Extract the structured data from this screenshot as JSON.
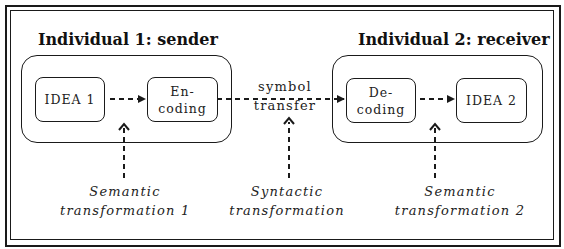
{
  "diagram": {
    "sender": {
      "title": "Individual 1: sender",
      "idea": "IDEA 1",
      "encoding": [
        "En-",
        "coding"
      ]
    },
    "receiver": {
      "title": "Individual 2: receiver",
      "decoding": [
        "De-",
        "coding"
      ],
      "idea": "IDEA 2"
    },
    "channel": {
      "line1": "symbol",
      "line2": "transfer"
    },
    "transformations": [
      {
        "line1": "Semantic",
        "line2": "transformation 1"
      },
      {
        "line1": "Syntactic",
        "line2": "transformation"
      },
      {
        "line1": "Semantic",
        "line2": "transformation 2"
      }
    ],
    "colors": {
      "stroke": "#1a1a1a",
      "background": "#ffffff"
    }
  }
}
